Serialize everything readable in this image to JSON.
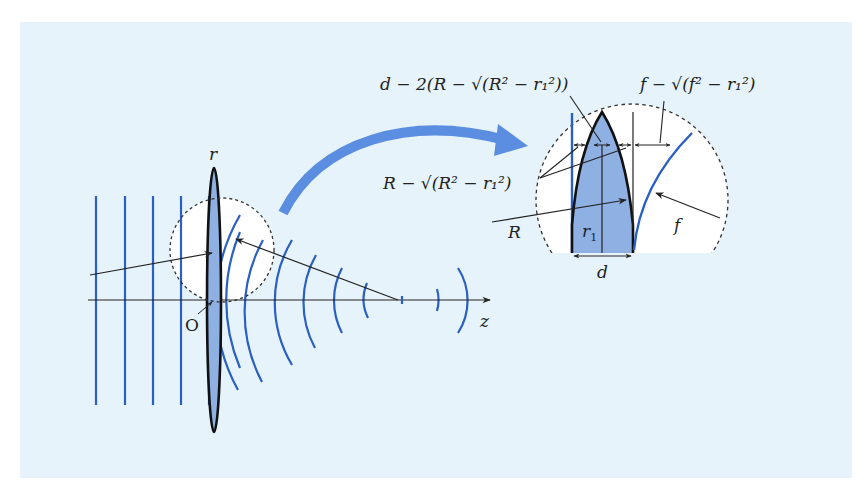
{
  "figure": {
    "type": "lens-wavefront-diagram",
    "colors": {
      "background_panel": "#e6f3fa",
      "wave": "#2a5fc4",
      "lens_fill": "#8fb0e3",
      "curved_arrow": "#5b8ee0",
      "line": "#222222"
    },
    "axes": {
      "vertical_label": "r",
      "horizontal_label": "z",
      "origin_label": "O"
    },
    "main_view": {
      "plane_wavefront_count": 5,
      "converging_wavefront_count": 8
    },
    "inset": {
      "label_R": "R",
      "label_r1": "r",
      "label_r1_sub": "1",
      "label_f": "f",
      "label_d": "d",
      "expr_center_thickness": "d − 2(R − √(R² − r₁²))",
      "expr_sag_lens": "R − √(R² − r₁²)",
      "expr_sag_focus": "f − √(f² − r₁²)"
    }
  }
}
